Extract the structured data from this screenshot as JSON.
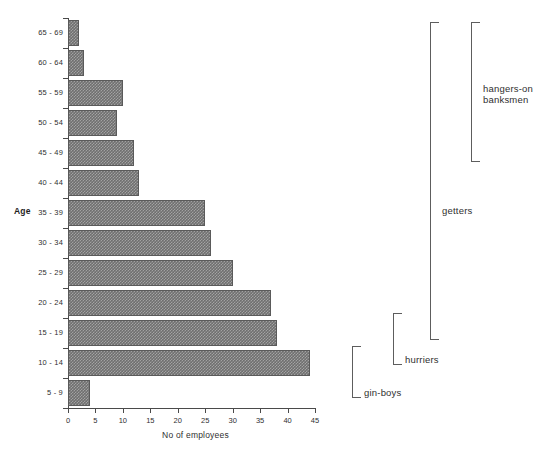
{
  "chart_data": {
    "type": "bar",
    "orientation": "horizontal",
    "title": "",
    "xlabel": "No of employees",
    "ylabel": "Age",
    "xlim": [
      0,
      45
    ],
    "ylim_categories": true,
    "grid": false,
    "legend": false,
    "xticks": [
      "0",
      "5",
      "10",
      "15",
      "20",
      "25",
      "30",
      "35",
      "40",
      "45"
    ],
    "xtick_values": [
      0,
      5,
      10,
      15,
      20,
      25,
      30,
      35,
      40,
      45
    ],
    "categories": [
      "65 - 69",
      "60 - 64",
      "55 - 59",
      "50 - 54",
      "45 - 49",
      "40 - 44",
      "35 - 39",
      "30 - 34",
      "25 - 29",
      "20 - 24",
      "15 - 19",
      "10 - 14",
      "5 - 9"
    ],
    "values": [
      2,
      3,
      10,
      9,
      12,
      13,
      25,
      26,
      30,
      37,
      38,
      44,
      4
    ],
    "bar_color": "#6f6f6f",
    "annotations": [
      {
        "label": "hangers-on\nbanksmen",
        "line1": "hangers-on",
        "line2": "banksmen",
        "covers": [
          "65 - 69",
          "60 - 64",
          "55 - 59",
          "50 - 54",
          "45 - 49"
        ]
      },
      {
        "label": "getters",
        "line1": "getters",
        "covers": [
          "65 - 69",
          "60 - 64",
          "55 - 59",
          "50 - 54",
          "45 - 49",
          "40 - 44",
          "35 - 39",
          "30 - 34",
          "25 - 29",
          "20 - 24",
          "15 - 19"
        ]
      },
      {
        "label": "hurriers",
        "line1": "hurriers",
        "covers": [
          "15 - 19",
          "10 - 14"
        ]
      },
      {
        "label": "gin-boys",
        "line1": "gin-boys",
        "covers": [
          "10 - 14",
          "5 - 9"
        ]
      }
    ]
  },
  "axes": {
    "x_title": "No of employees",
    "y_title": "Age"
  },
  "annotations": {
    "hangers_on_line1": "hangers-on",
    "hangers_on_line2": "banksmen",
    "getters": "getters",
    "hurriers": "hurriers",
    "gin_boys": "gin-boys"
  }
}
